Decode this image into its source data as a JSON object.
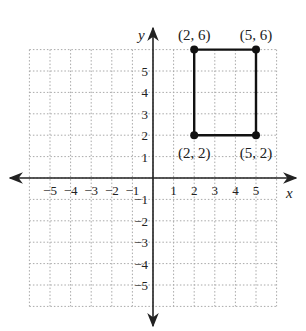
{
  "chart_data": {
    "type": "scatter",
    "title": "",
    "xlabel": "x",
    "ylabel": "y",
    "xlim": [
      -6,
      6
    ],
    "ylim": [
      -6,
      6
    ],
    "grid": true,
    "grid_style": "dotted",
    "x_ticks": [
      -5,
      -4,
      -3,
      -2,
      -1,
      1,
      2,
      3,
      4,
      5
    ],
    "y_ticks": [
      -5,
      -4,
      -3,
      -2,
      -1,
      1,
      2,
      3,
      4,
      5
    ],
    "x_tick_labels": [
      "−5",
      "−4",
      "−3",
      "−2",
      "−1",
      "1",
      "2",
      "3",
      "4",
      "5"
    ],
    "y_tick_labels": [
      "−5",
      "−4",
      "−3",
      "−2",
      "−1",
      "1",
      "2",
      "3",
      "4",
      "5"
    ],
    "series": [
      {
        "name": "rectangle",
        "closed_polygon": true,
        "points": [
          {
            "x": 2,
            "y": 6,
            "label": "(2, 6)"
          },
          {
            "x": 5,
            "y": 6,
            "label": "(5, 6)"
          },
          {
            "x": 5,
            "y": 2,
            "label": "(5, 2)"
          },
          {
            "x": 2,
            "y": 2,
            "label": "(2, 2)"
          }
        ]
      }
    ]
  },
  "style": {
    "line_color": "#111111",
    "grid_color": "#a8a8a8",
    "axis_color": "#222222"
  }
}
